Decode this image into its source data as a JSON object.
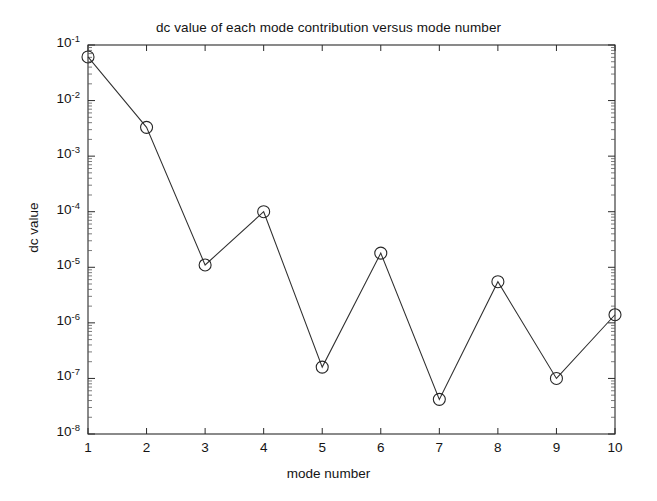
{
  "chart_data": {
    "type": "line",
    "title": "dc value of each mode contribution versus mode number",
    "xlabel": "mode number",
    "ylabel": "dc value",
    "yscale": "log",
    "xlim": [
      1,
      10
    ],
    "ylim": [
      1e-08,
      0.1
    ],
    "grid": false,
    "legend": null,
    "marker": "circle",
    "x": [
      1,
      2,
      3,
      4,
      5,
      6,
      7,
      8,
      9,
      10
    ],
    "values": [
      0.061,
      0.0033,
      1.1e-05,
      0.0001,
      1.6e-07,
      1.8e-05,
      4.2e-08,
      5.5e-06,
      1e-07,
      1.4e-06
    ],
    "xticks": [
      "1",
      "2",
      "3",
      "4",
      "5",
      "6",
      "7",
      "8",
      "9",
      "10"
    ],
    "ytick_mantissa": "10",
    "yticks": [
      {
        "exp": "-1",
        "value": 0.1
      },
      {
        "exp": "-2",
        "value": 0.01
      },
      {
        "exp": "-3",
        "value": 0.001
      },
      {
        "exp": "-4",
        "value": 0.0001
      },
      {
        "exp": "-5",
        "value": 1e-05
      },
      {
        "exp": "-6",
        "value": 1e-06
      },
      {
        "exp": "-7",
        "value": 1e-07
      },
      {
        "exp": "-8",
        "value": 1e-08
      }
    ]
  },
  "colors": {
    "line": "#303030",
    "marker": "#262626",
    "axis": "#2b2b2b",
    "text": "#141414",
    "background": "#ffffff"
  }
}
